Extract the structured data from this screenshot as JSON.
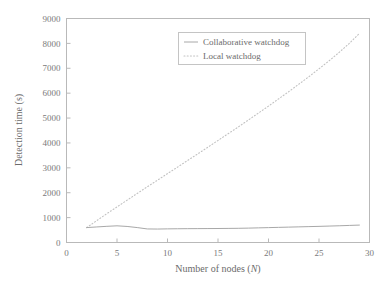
{
  "chart_data": {
    "type": "line",
    "title": "",
    "xlabel": "Number of nodes (N)",
    "xlabel_text": "Number of nodes (",
    "xlabel_italic": "N",
    "xlabel_tail": ")",
    "ylabel": "Detection time (s)",
    "xlim": [
      0,
      30
    ],
    "ylim": [
      0,
      9000
    ],
    "grid": false,
    "legend_position": "top-center",
    "xticks": [
      0,
      5,
      10,
      15,
      20,
      25,
      30
    ],
    "xtick_labels": [
      "0",
      "5",
      "10",
      "15",
      "20",
      "25",
      "30"
    ],
    "yticks": [
      0,
      1000,
      2000,
      3000,
      4000,
      5000,
      6000,
      7000,
      8000,
      9000
    ],
    "ytick_labels": [
      "0",
      "1000",
      "2000",
      "3000",
      "4000",
      "5000",
      "6000",
      "7000",
      "8000",
      "9000"
    ],
    "x": [
      2,
      3,
      4,
      5,
      6,
      7,
      8,
      9,
      10,
      11,
      12,
      13,
      14,
      15,
      16,
      17,
      18,
      19,
      20,
      21,
      22,
      23,
      24,
      25,
      26,
      27,
      28,
      29
    ],
    "series": [
      {
        "name": "Collaborative watchdog",
        "style": "solid",
        "color": "#a8a8a8",
        "values": [
          600,
          625,
          650,
          670,
          645,
          600,
          545,
          540,
          548,
          552,
          556,
          558,
          560,
          562,
          566,
          570,
          578,
          588,
          598,
          608,
          618,
          628,
          638,
          648,
          660,
          672,
          686,
          700
        ]
      },
      {
        "name": "Local watchdog",
        "style": "dotted",
        "color": "#c2c2c2",
        "values": [
          600,
          880,
          1160,
          1430,
          1700,
          1970,
          2240,
          2500,
          2770,
          3030,
          3300,
          3560,
          3830,
          4100,
          4370,
          4640,
          4920,
          5200,
          5480,
          5770,
          6060,
          6360,
          6660,
          6980,
          7300,
          7640,
          8000,
          8400
        ]
      }
    ]
  },
  "legend": {
    "entries": [
      {
        "label": "Collaborative watchdog",
        "style": "solid"
      },
      {
        "label": "Local watchdog",
        "style": "dotted"
      }
    ]
  }
}
